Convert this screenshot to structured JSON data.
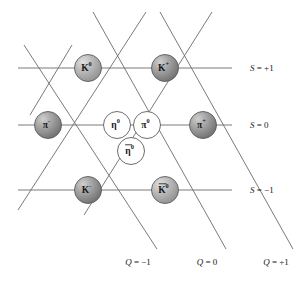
{
  "figure": {
    "type": "weight-diagram",
    "title": ""
  },
  "colors": {
    "line": "#6b6b6b",
    "node_stroke": "#5c5c5c",
    "node_dark_fill": "#9a9a9a",
    "node_dark_highlight": "#c8c8c8",
    "node_medium_fill": "#b0b0b0",
    "node_light_fill": "#ffffff",
    "text": "#1a1a1a",
    "background": "#ffffff"
  },
  "nodes": [
    {
      "id": "k0",
      "base": "K",
      "sup": "⁰",
      "sup_text": "0",
      "bar": false,
      "label": "K⁰",
      "cx": 88,
      "cy": 68,
      "r": 13.5,
      "shade": "medium"
    },
    {
      "id": "kplus",
      "base": "K",
      "sup": "⁺",
      "sup_text": "+",
      "bar": false,
      "label": "K⁺",
      "cx": 165,
      "cy": 68,
      "r": 13.5,
      "shade": "dark"
    },
    {
      "id": "piminus",
      "base": "π",
      "sup": "⁻",
      "sup_text": "-",
      "bar": false,
      "label": "π⁻",
      "cx": 48,
      "cy": 125,
      "r": 13.5,
      "shade": "dark"
    },
    {
      "id": "eta0",
      "base": "η",
      "sup": "⁰",
      "sup_text": "0",
      "bar": false,
      "label": "η⁰",
      "cx": 117,
      "cy": 125,
      "r": 13.5,
      "shade": "light"
    },
    {
      "id": "pi0",
      "base": "π",
      "sup": "⁰",
      "sup_text": "0",
      "bar": false,
      "label": "π⁰",
      "cx": 147,
      "cy": 125,
      "r": 13.5,
      "shade": "light"
    },
    {
      "id": "piplus",
      "base": "π",
      "sup": "⁺",
      "sup_text": "+",
      "bar": false,
      "label": "π⁺",
      "cx": 203,
      "cy": 125,
      "r": 13.5,
      "shade": "dark"
    },
    {
      "id": "etabar0",
      "base": "η",
      "sup": "⁰",
      "sup_text": "0",
      "bar": true,
      "label": "η̄⁰",
      "cx": 131,
      "cy": 151,
      "r": 13.5,
      "shade": "light"
    },
    {
      "id": "kminus",
      "base": "K",
      "sup": "⁻",
      "sup_text": "-",
      "bar": false,
      "label": "K⁻",
      "cx": 88,
      "cy": 190,
      "r": 13.5,
      "shade": "dark"
    },
    {
      "id": "kbar0",
      "base": "K",
      "sup": "⁰",
      "sup_text": "0",
      "bar": true,
      "label": "K̄⁰",
      "cx": 165,
      "cy": 190,
      "r": 13.5,
      "shade": "medium"
    }
  ],
  "strangeness_axis": {
    "name": "S",
    "rows": [
      {
        "id": "s-plus-1",
        "value": "+1",
        "label": "S = +1",
        "symbol": "S",
        "eq": "=",
        "val": "+1",
        "y": 68,
        "x1": 18,
        "x2": 232,
        "label_x": 250,
        "label_y": 68
      },
      {
        "id": "s-zero",
        "value": "0",
        "label": "S = 0",
        "symbol": "S",
        "eq": "=",
        "val": "0",
        "y": 125,
        "x1": 18,
        "x2": 232,
        "label_x": 250,
        "label_y": 125
      },
      {
        "id": "s-minus-1",
        "value": "-1",
        "label": "S = -1",
        "symbol": "S",
        "eq": "=",
        "val": "−1",
        "y": 190,
        "x1": 18,
        "x2": 232,
        "label_x": 250,
        "label_y": 190
      }
    ]
  },
  "charge_axis": {
    "name": "Q",
    "columns": [
      {
        "id": "q-minus-1",
        "value": "-1",
        "label": "Q = -1",
        "symbol": "Q",
        "eq": "=",
        "val": "−1",
        "label_x": 138,
        "label_y": 265
      },
      {
        "id": "q-zero",
        "value": "0",
        "label": "Q = 0",
        "symbol": "Q",
        "eq": "=",
        "val": "0",
        "label_x": 207,
        "label_y": 265
      },
      {
        "id": "q-plus-1",
        "value": "+1",
        "label": "Q = +1",
        "symbol": "Q",
        "eq": "=",
        "val": "+1",
        "label_x": 276,
        "label_y": 265
      }
    ]
  },
  "lattice_lines": {
    "horizontal": [
      {
        "id": "h-top",
        "x1": 18,
        "y1": 68,
        "x2": 232,
        "y2": 68
      },
      {
        "id": "h-middle",
        "x1": 18,
        "y1": 125,
        "x2": 232,
        "y2": 125
      },
      {
        "id": "h-bottom",
        "x1": 18,
        "y1": 190,
        "x2": 232,
        "y2": 190
      }
    ],
    "diagonal_down_right": [
      {
        "id": "d-right-1",
        "x1": 24,
        "y1": 45,
        "x2": 157,
        "y2": 249
      },
      {
        "id": "d-right-2",
        "x1": 93,
        "y1": 12,
        "x2": 226,
        "y2": 249
      },
      {
        "id": "d-right-3",
        "x1": 160,
        "y1": 12,
        "x2": 293,
        "y2": 249
      }
    ],
    "diagonal_down_left": [
      {
        "id": "d-left-1",
        "x1": 146,
        "y1": 12,
        "x2": 18,
        "y2": 210
      },
      {
        "id": "d-left-2",
        "x1": 212,
        "y1": 12,
        "x2": 84,
        "y2": 215
      },
      {
        "id": "d-left-3",
        "x1": 72,
        "y1": 45,
        "x2": 30,
        "y2": 115
      }
    ]
  }
}
